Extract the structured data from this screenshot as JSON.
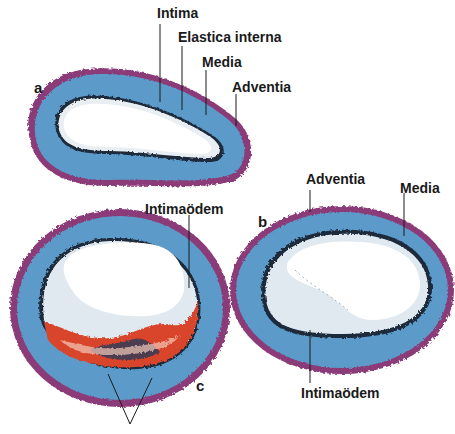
{
  "figure": {
    "panels": [
      {
        "id": "a",
        "letter": "a",
        "description": "Normal artery cross-section"
      },
      {
        "id": "b",
        "letter": "b",
        "description": "Artery with intimal edema"
      },
      {
        "id": "c",
        "letter": "c",
        "description": "Artery with intimal edema and hemorrhage/deposits"
      }
    ],
    "labels": {
      "a_intima": "Intima",
      "a_elastica": "Elastica interna",
      "a_media": "Media",
      "a_adventitia": "Adventia",
      "b_adventitia": "Adventia",
      "b_media": "Media",
      "b_intimaodem": "Intimaödem",
      "c_intimaodem": "Intimaödem"
    },
    "colors": {
      "adventitia": "#8a3a78",
      "media": "#5b9bc9",
      "elastica": "#1c2a3a",
      "intima_edema": "#dfe9ef",
      "lumen": "#ffffff",
      "deposit_red": "#d9452a",
      "deposit_dark": "#2a3a5a"
    }
  }
}
